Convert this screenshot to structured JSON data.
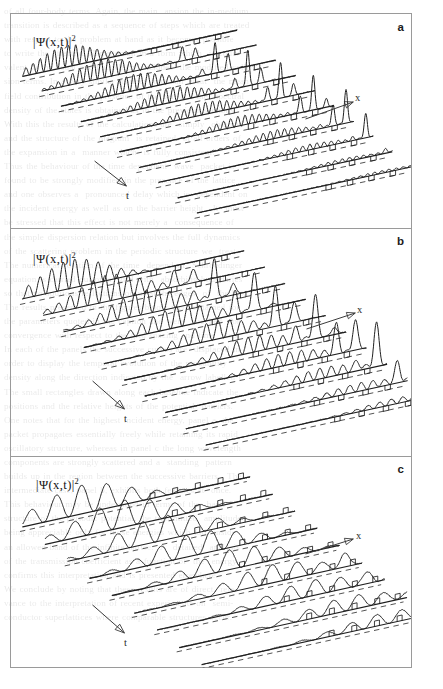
{
  "figure": {
    "type": "waterfall-3d-wavefunction-evolution",
    "frame": {
      "x": 10,
      "y": 13,
      "width": 402,
      "height": 655,
      "border_color": "#9a9a9a"
    },
    "background_color": "#ffffff",
    "trace_color": "#1f1f1f",
    "dashed_baseline_color": "#4a4a4a",
    "panels": [
      {
        "id": "a",
        "label": "a",
        "y_axis_label": "|Ψ(x,t)|",
        "y_axis_label_exponent": "2",
        "x_axis_label": "x",
        "t_axis_label": "t",
        "n_traces": 10,
        "description": "High frequency oscillatory packet; narrow tall transmitted spikes; barriers shown as small square notches"
      },
      {
        "id": "b",
        "label": "b",
        "y_axis_label": "|Ψ(x,t)|",
        "y_axis_label_exponent": "2",
        "x_axis_label": "x",
        "t_axis_label": "t",
        "n_traces": 10,
        "description": "Medium frequency large amplitude oscillations with tall transmitted peaks moving right over time"
      },
      {
        "id": "c",
        "label": "c",
        "y_axis_label": "|Ψ(x,t)|",
        "y_axis_label_exponent": "2",
        "x_axis_label": "x",
        "t_axis_label": "t",
        "n_traces": 9,
        "description": "Low frequency broad smooth humps with barrier markers along the baseline"
      }
    ]
  },
  "chart_data": {
    "type": "line",
    "title": "",
    "xlabel": "x",
    "ylabel": "|Ψ(x,t)|²",
    "zlabel": "t",
    "grid": false,
    "legend": null,
    "panels": [
      {
        "label": "a",
        "wave_cycles": 30,
        "envelope_center_start": 0.2,
        "envelope_center_step": 0.072,
        "envelope_width": 0.26,
        "amplitude": 1.0,
        "spike_amplitude": 2.1,
        "barrier_count": 4
      },
      {
        "label": "b",
        "wave_cycles": 19,
        "envelope_center_start": 0.22,
        "envelope_center_step": 0.07,
        "envelope_width": 0.3,
        "amplitude": 1.25,
        "spike_amplitude": 2.4,
        "barrier_count": 4
      },
      {
        "label": "c",
        "wave_cycles": 9,
        "envelope_center_start": 0.26,
        "envelope_center_step": 0.068,
        "envelope_width": 0.4,
        "amplitude": 1.15,
        "spike_amplitude": 1.6,
        "barrier_count": 5
      }
    ]
  },
  "ghost_text": {
    "content": "of all four-body terms. Again, the main  ansion the in-medium\ntransition is described as a sequence of steps which are treated\nwith respect to the problem at hand as it becomes possible\nto write the effective Hamiltonian in a form which  is equiv-\nvalent to the usual one but which  includes  the modified colli-\nsion terms. In a very similar manner  one can  treat  the mean\nfield contribution in the presence of the barrier,  the  spectral\ndensity of the states is obtained as in the previous sections.\nWith this the results of the calculations are  simply  obtained\nand the structure of the diagram  is retained  at all orders of\nthe expansion in a  manner which  is fully consistent.\nThus the behaviour of the time dependent  wave  packet is\nfound to be strongly modified in the presence of the lattice\nand one observes a  pronounced delay which is  dependent on\nthe incident energy as well as on the barrier height.  It  must\nbe stressed that this effect is not merely a  consequence of\nthe simple dispersion relation but involves the full dynamics\nof the scattering problem in the periodic structure we  treat.\nThe numerical solution of the time  dependent  Schroedinger\nequation is carried out on a  grid with  absorbing boundaries\nso that no spurious reflections occur at the edges  of  the box.\nThe results presented in the figures below were obtained for\nthe parameters quoted in the caption and were  checked  for\nconvergence with respect to the grid spacing and time  step.\nIn each of the panels the successive curves are  displaced in\norder to display the temporal evolution of the probability\ndensity along the direction indicated by the  arrow labelled t.\nThe small rectangles drawn along each baseline indicate the\npositions and the relative heights of the potential  barriers.\nOne notes that for the highest incident energy, panel a, the\npacket propagates essentially freely while retaining its rapid\noscillatory structure, whereas in panel c the long wavelength\ncomponents are strongly scattered and a  standing  pattern\nbuilds up in the region between the successive barriers.  The\nintermediate case, panel b, exhibits both features at  once.\nThis behaviour may be understood in terms of the  band\nstructure of the periodic potential, the transmitted  amplitude\nbeing appreciable only for those energies which fall  inside\nan allowed band of the infinite lattice.  A  detailed  analysis\nof the transmission coefficient as a function of  the  energy\nconfirms this interpretation and is presented elsewhere.\nWe conclude by noting that these results are of direct  rele-\nvance to the interpretation of recent experiments on  semi-\nconductor superlattices where comparable structures occur."
  }
}
